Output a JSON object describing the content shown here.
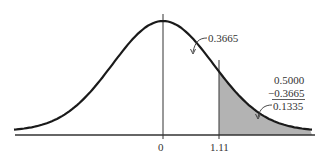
{
  "chart_data": {
    "type": "area",
    "title": "",
    "xlabel": "",
    "ylabel": "",
    "x_ticks": [
      "0",
      "1.11"
    ],
    "xlim": [
      -2.95,
      2.95
    ],
    "grid": false,
    "series": [
      {
        "name": "standard normal density",
        "mean": 0,
        "sd": 1
      },
      {
        "name": "shaded tail",
        "from": 1.11,
        "to": 2.95,
        "fill": "#b3b3b3"
      }
    ],
    "annotations": [
      {
        "text": "0.3665",
        "target": "area between 0 and 1.11"
      },
      {
        "text": "0.5000",
        "role": "subtraction-top"
      },
      {
        "text": "−0.3665",
        "role": "subtraction-subtrahend",
        "underlined": true
      },
      {
        "text": "0.1335",
        "role": "subtraction-result",
        "target": "shaded tail area"
      }
    ]
  },
  "labels": {
    "tick_zero": "0",
    "tick_z": "1.11",
    "area_center": "0.3665",
    "calc_top": "0.5000",
    "calc_sub": "−0.3665",
    "calc_result": "0.1335"
  },
  "colors": {
    "curve": "#1a1a1a",
    "shade": "#b3b3b3",
    "axis": "#333333"
  }
}
